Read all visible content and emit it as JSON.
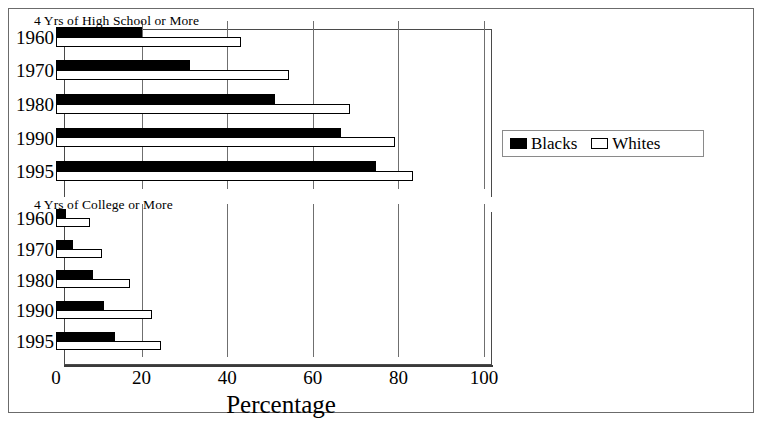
{
  "chart_data": {
    "type": "bar",
    "orientation": "horizontal",
    "title": "",
    "xlabel": "Percentage",
    "ylabel": "",
    "xlim": [
      0,
      100
    ],
    "xticks": [
      0,
      20,
      40,
      60,
      80,
      100
    ],
    "xtick_labels": [
      "0",
      "20",
      "40",
      "60",
      "80",
      "100"
    ],
    "grid": "vertical",
    "legend": {
      "position": "right",
      "entries": [
        {
          "name": "Blacks",
          "color": "#000000",
          "style": "filled"
        },
        {
          "name": "Whites",
          "color": "#ffffff",
          "style": "outlined"
        }
      ]
    },
    "panels": [
      {
        "title": "4 Yrs of High School or More",
        "categories": [
          "1960",
          "1970",
          "1980",
          "1990",
          "1995"
        ],
        "series": [
          {
            "name": "Blacks",
            "values": [
              20,
              31.4,
              51.2,
              66.7,
              74.8
            ]
          },
          {
            "name": "Whites",
            "values": [
              43.2,
              54.5,
              68.8,
              79.1,
              83.5
            ]
          }
        ]
      },
      {
        "title": "4 Yrs of College or More",
        "categories": [
          "1960",
          "1970",
          "1980",
          "1990",
          "1995"
        ],
        "series": [
          {
            "name": "Blacks",
            "values": [
              2.3,
              3.9,
              8.6,
              11.3,
              13.7
            ]
          },
          {
            "name": "Whites",
            "values": [
              8.0,
              10.7,
              17.4,
              22.5,
              24.5
            ]
          }
        ]
      }
    ]
  },
  "colors": {
    "blacks": "#000000",
    "whites": "#ffffff",
    "frame": "#6b6b6b",
    "axis": "#3a3a3a",
    "grid": "#6f6f6f"
  }
}
